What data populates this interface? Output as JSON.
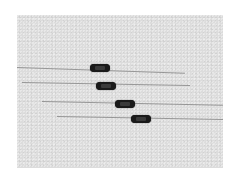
{
  "image": {
    "description": "Photograph of four axial-lead components (resistor/inductor style) on a light grey background, arranged diagonally",
    "background_color": "#dcdcdc",
    "component_color": "#1a1a1a",
    "lead_color": "#8a8a8a"
  },
  "components": [
    {
      "id": 1,
      "body": {
        "x": 90,
        "y": 64,
        "w": 20,
        "h": 8
      },
      "lead": {
        "x1": 17,
        "y1": 67,
        "x2": 185,
        "y2": 73
      }
    },
    {
      "id": 2,
      "body": {
        "x": 96,
        "y": 82,
        "w": 20,
        "h": 8
      },
      "lead": {
        "x1": 22,
        "y1": 82,
        "x2": 190,
        "y2": 85
      }
    },
    {
      "id": 3,
      "body": {
        "x": 115,
        "y": 100,
        "w": 20,
        "h": 8
      },
      "lead": {
        "x1": 42,
        "y1": 101,
        "x2": 223,
        "y2": 105
      }
    },
    {
      "id": 4,
      "body": {
        "x": 131,
        "y": 115,
        "w": 20,
        "h": 8
      },
      "lead": {
        "x1": 57,
        "y1": 116,
        "x2": 223,
        "y2": 119
      }
    }
  ]
}
